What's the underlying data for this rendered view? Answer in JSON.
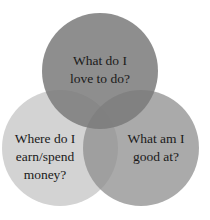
{
  "diagram": {
    "type": "venn",
    "circles": [
      {
        "id": "love",
        "lines": [
          "What do I",
          "love to do?"
        ],
        "color": "#8c8c8c"
      },
      {
        "id": "money",
        "lines": [
          "Where do I",
          "earn/spend",
          "money?"
        ],
        "color": "#d4d4d4"
      },
      {
        "id": "good",
        "lines": [
          "What am I",
          "good at?"
        ],
        "color": "#a9a9a9"
      }
    ]
  }
}
